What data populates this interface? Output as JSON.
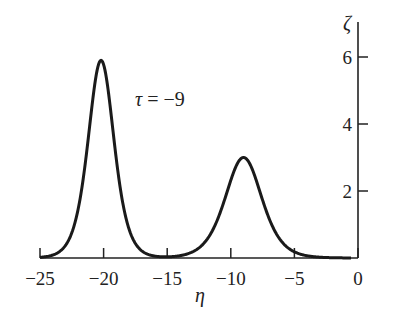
{
  "chart_data": {
    "type": "line",
    "title": "",
    "annotation": "τ = −9",
    "xlabel": "η",
    "ylabel": "ζ",
    "xlim": [
      -25,
      0
    ],
    "ylim": [
      0,
      6.5
    ],
    "x_ticks": [
      "−25",
      "−20",
      "−15",
      "−10",
      "−5",
      "0"
    ],
    "y_ticks": [
      "2",
      "4",
      "6"
    ],
    "y_axis_position": "right",
    "grid": false,
    "legend": null,
    "series": [
      {
        "name": "ζ(η) at τ = −9",
        "shape": "two sech² solitons",
        "peaks": [
          {
            "eta": -20.2,
            "zeta": 5.9,
            "half_width": 1.2
          },
          {
            "eta": -9.0,
            "zeta": 3.0,
            "half_width": 1.7
          }
        ],
        "x": [
          -25,
          -24,
          -23,
          -22,
          -21.5,
          -21,
          -20.5,
          -20.2,
          -20,
          -19.5,
          -19,
          -18.5,
          -18,
          -17,
          -16,
          -15,
          -14,
          -13,
          -12,
          -11,
          -10,
          -9.5,
          -9,
          -8.5,
          -8,
          -7,
          -6,
          -5,
          -4,
          -3,
          -2,
          -1,
          0
        ],
        "values": [
          0.02,
          0.1,
          0.45,
          1.9,
          3.3,
          4.9,
          5.75,
          5.9,
          5.85,
          5.0,
          3.5,
          2.2,
          1.3,
          0.4,
          0.12,
          0.05,
          0.08,
          0.2,
          0.5,
          1.2,
          2.3,
          2.8,
          3.0,
          2.8,
          2.3,
          1.2,
          0.5,
          0.2,
          0.07,
          0.03,
          0.01,
          0.0,
          0.0
        ]
      }
    ]
  }
}
